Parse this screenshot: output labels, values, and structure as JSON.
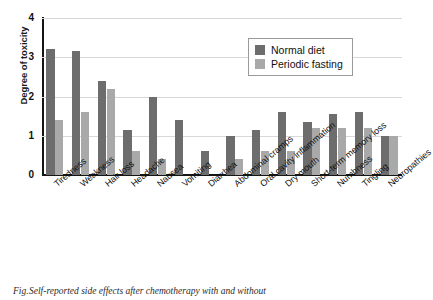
{
  "chart_data": {
    "type": "bar",
    "title": "",
    "xlabel": "",
    "ylabel": "Degree of toxicity",
    "ylim": [
      0,
      4
    ],
    "yticks": [
      "0",
      "1",
      "2",
      "3",
      "4"
    ],
    "grid": true,
    "legend_position": "top-right",
    "categories": [
      "Tiredness",
      "Weakness",
      "Hair loss",
      "Headache",
      "Nausea",
      "Vomiting",
      "Diarrhea",
      "Abdominal cramps",
      "Oral cavity inflammation",
      "Dry mouth",
      "Short-term memory loss",
      "Numbness",
      "Tingling",
      "Neuropathies"
    ],
    "series": [
      {
        "name": "Normal diet",
        "color": "#6d6d6d",
        "values": [
          3.2,
          3.15,
          2.4,
          1.15,
          2.0,
          1.4,
          0.6,
          1.0,
          1.15,
          1.6,
          1.35,
          1.55,
          1.6,
          1.0
        ]
      },
      {
        "name": "Periodic fasting",
        "color": "#a9a9a9",
        "values": [
          1.4,
          1.6,
          2.2,
          0.6,
          0.4,
          0.0,
          0.0,
          0.4,
          0.6,
          0.6,
          1.2,
          1.2,
          1.2,
          1.0
        ]
      }
    ]
  },
  "legend": {
    "items": [
      {
        "label": "Normal diet",
        "color": "#6d6d6d"
      },
      {
        "label": "Periodic fasting",
        "color": "#a9a9a9"
      }
    ]
  },
  "caption": {
    "marker": "Fig.",
    "text": "Self-reported side effects after chemotherapy with and without"
  }
}
